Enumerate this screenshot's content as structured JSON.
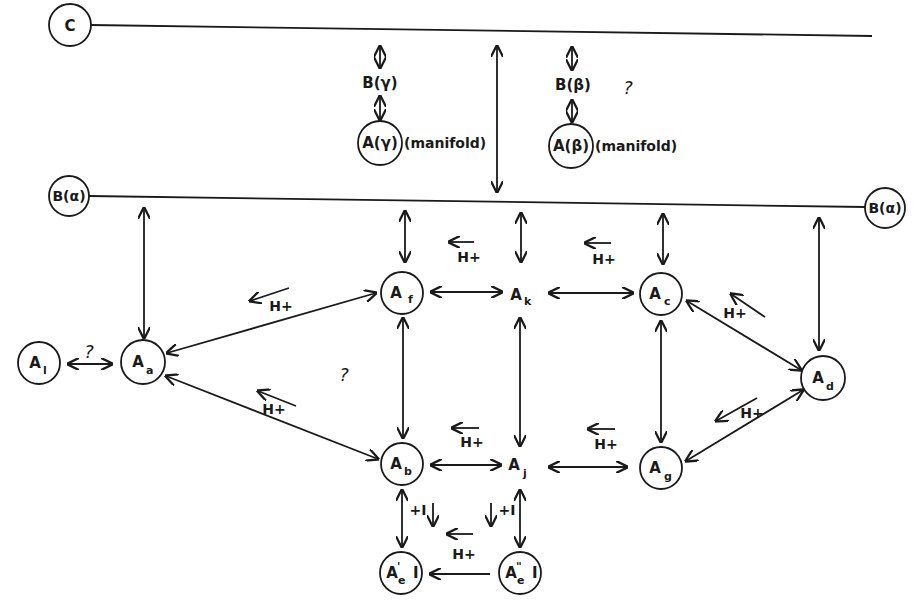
{
  "diagram": {
    "type": "state-transition-scheme",
    "nodes": {
      "C": {
        "label": "C"
      },
      "B_alpha_left": {
        "label": "B(α)"
      },
      "B_alpha_right": {
        "label": "B(α)"
      },
      "B_gamma": {
        "label": "B(γ)"
      },
      "A_gamma": {
        "label": "A(γ)",
        "note": "(manifold)"
      },
      "B_beta": {
        "label": "B(β)",
        "question": "?"
      },
      "A_beta": {
        "label": "A(β)",
        "note": "(manifold)"
      },
      "A_l": {
        "main": "A",
        "sub": "l"
      },
      "A_a": {
        "main": "A",
        "sub": "a"
      },
      "A_f": {
        "main": "A",
        "sub": "f"
      },
      "A_k": {
        "main": "A",
        "sub": "k"
      },
      "A_c": {
        "main": "A",
        "sub": "c"
      },
      "A_d": {
        "main": "A",
        "sub": "d"
      },
      "A_b": {
        "main": "A",
        "sub": "b"
      },
      "A_j": {
        "main": "A",
        "sub": "j"
      },
      "A_g": {
        "main": "A",
        "sub": "g"
      },
      "A_e1_I": {
        "main": "A",
        "sup": "'",
        "sub": "e",
        "suffix": "I"
      },
      "A_e2_I": {
        "main": "A",
        "sup": "\"",
        "sub": "e",
        "suffix": "I"
      }
    },
    "annotations": {
      "proton": "H+",
      "plus_I": "+I",
      "question": "?"
    },
    "edges": [
      {
        "from": "C",
        "to": "B_alpha",
        "type": "bidirectional"
      },
      {
        "from": "C",
        "to": "B_gamma",
        "type": "bidirectional"
      },
      {
        "from": "B_gamma",
        "to": "A_gamma",
        "type": "bidirectional"
      },
      {
        "from": "C",
        "to": "B_beta",
        "type": "bidirectional"
      },
      {
        "from": "B_beta",
        "to": "A_beta",
        "type": "bidirectional"
      },
      {
        "from": "B_alpha",
        "to": "A_a",
        "type": "bidirectional"
      },
      {
        "from": "B_alpha",
        "to": "A_f",
        "type": "bidirectional"
      },
      {
        "from": "B_alpha",
        "to": "A_k",
        "type": "bidirectional"
      },
      {
        "from": "B_alpha",
        "to": "A_c",
        "type": "bidirectional"
      },
      {
        "from": "B_alpha",
        "to": "A_d",
        "type": "bidirectional"
      },
      {
        "from": "A_l",
        "to": "A_a",
        "type": "bidirectional",
        "label": "?"
      },
      {
        "from": "A_a",
        "to": "A_f",
        "type": "bidirectional",
        "label": "H+"
      },
      {
        "from": "A_a",
        "to": "A_b",
        "type": "bidirectional",
        "label": "H+"
      },
      {
        "from": "A_f",
        "to": "A_k",
        "type": "bidirectional",
        "label": "H+"
      },
      {
        "from": "A_k",
        "to": "A_c",
        "type": "bidirectional",
        "label": "H+"
      },
      {
        "from": "A_c",
        "to": "A_d",
        "type": "bidirectional",
        "label": "H+"
      },
      {
        "from": "A_f",
        "to": "A_b",
        "type": "bidirectional"
      },
      {
        "from": "A_k",
        "to": "A_j",
        "type": "bidirectional"
      },
      {
        "from": "A_c",
        "to": "A_g",
        "type": "bidirectional"
      },
      {
        "from": "A_b",
        "to": "A_j",
        "type": "bidirectional",
        "label": "H+"
      },
      {
        "from": "A_j",
        "to": "A_g",
        "type": "bidirectional",
        "label": "H+"
      },
      {
        "from": "A_g",
        "to": "A_d",
        "type": "bidirectional",
        "label": "H+"
      },
      {
        "from": "A_b",
        "to": "A_e1_I",
        "type": "bidirectional",
        "label": "+I"
      },
      {
        "from": "A_j",
        "to": "A_e2_I",
        "type": "bidirectional",
        "label": "+I"
      },
      {
        "from": "A_e2_I",
        "to": "A_e1_I",
        "type": "unidirectional",
        "label": "H+"
      }
    ]
  }
}
